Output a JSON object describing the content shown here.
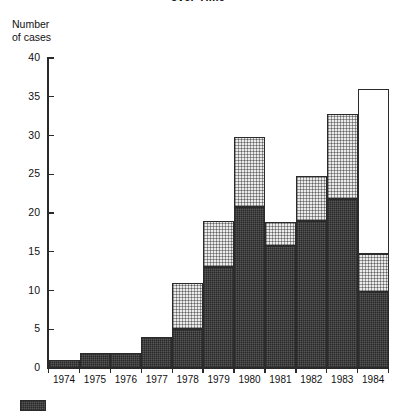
{
  "chart_data": {
    "type": "bar",
    "title": "over Time",
    "subtitle": "",
    "xlabel": "",
    "ylabel": "Number\nof cases",
    "ylim": [
      0,
      40
    ],
    "ytick_values": [
      0,
      5,
      10,
      15,
      20,
      25,
      30,
      35,
      40
    ],
    "ytick_labels": [
      "0",
      "5",
      "10",
      "15",
      "20",
      "25",
      "30",
      "35",
      "40"
    ],
    "grid": false,
    "stacked": true,
    "legend_position": "bottom-left",
    "categories": [
      "1974",
      "1975",
      "1976",
      "1977",
      "1978",
      "1979",
      "1980",
      "1981",
      "1982",
      "1983",
      "1984"
    ],
    "series": [
      {
        "name": "dark-hatched",
        "fill": "dark",
        "color": "#575757",
        "values": [
          1,
          2,
          2,
          4,
          5,
          13,
          20.8,
          15.7,
          19,
          21.8,
          9.8
        ]
      },
      {
        "name": "dotted",
        "fill": "dotted",
        "color": "#ebebeb",
        "values": [
          0,
          0,
          0,
          0,
          6,
          6,
          9,
          3.1,
          5.8,
          11,
          4.9
        ]
      },
      {
        "name": "open",
        "fill": "white",
        "color": "#ffffff",
        "values": [
          0,
          0,
          0,
          0,
          0,
          0,
          0,
          0,
          0,
          0,
          21.3
        ]
      }
    ],
    "totals": [
      1,
      2,
      2,
      4,
      11,
      19,
      29.8,
      18.8,
      24.8,
      32.8,
      36
    ]
  },
  "legend": {
    "items": [
      {
        "label": "",
        "fill": "dark"
      }
    ]
  }
}
